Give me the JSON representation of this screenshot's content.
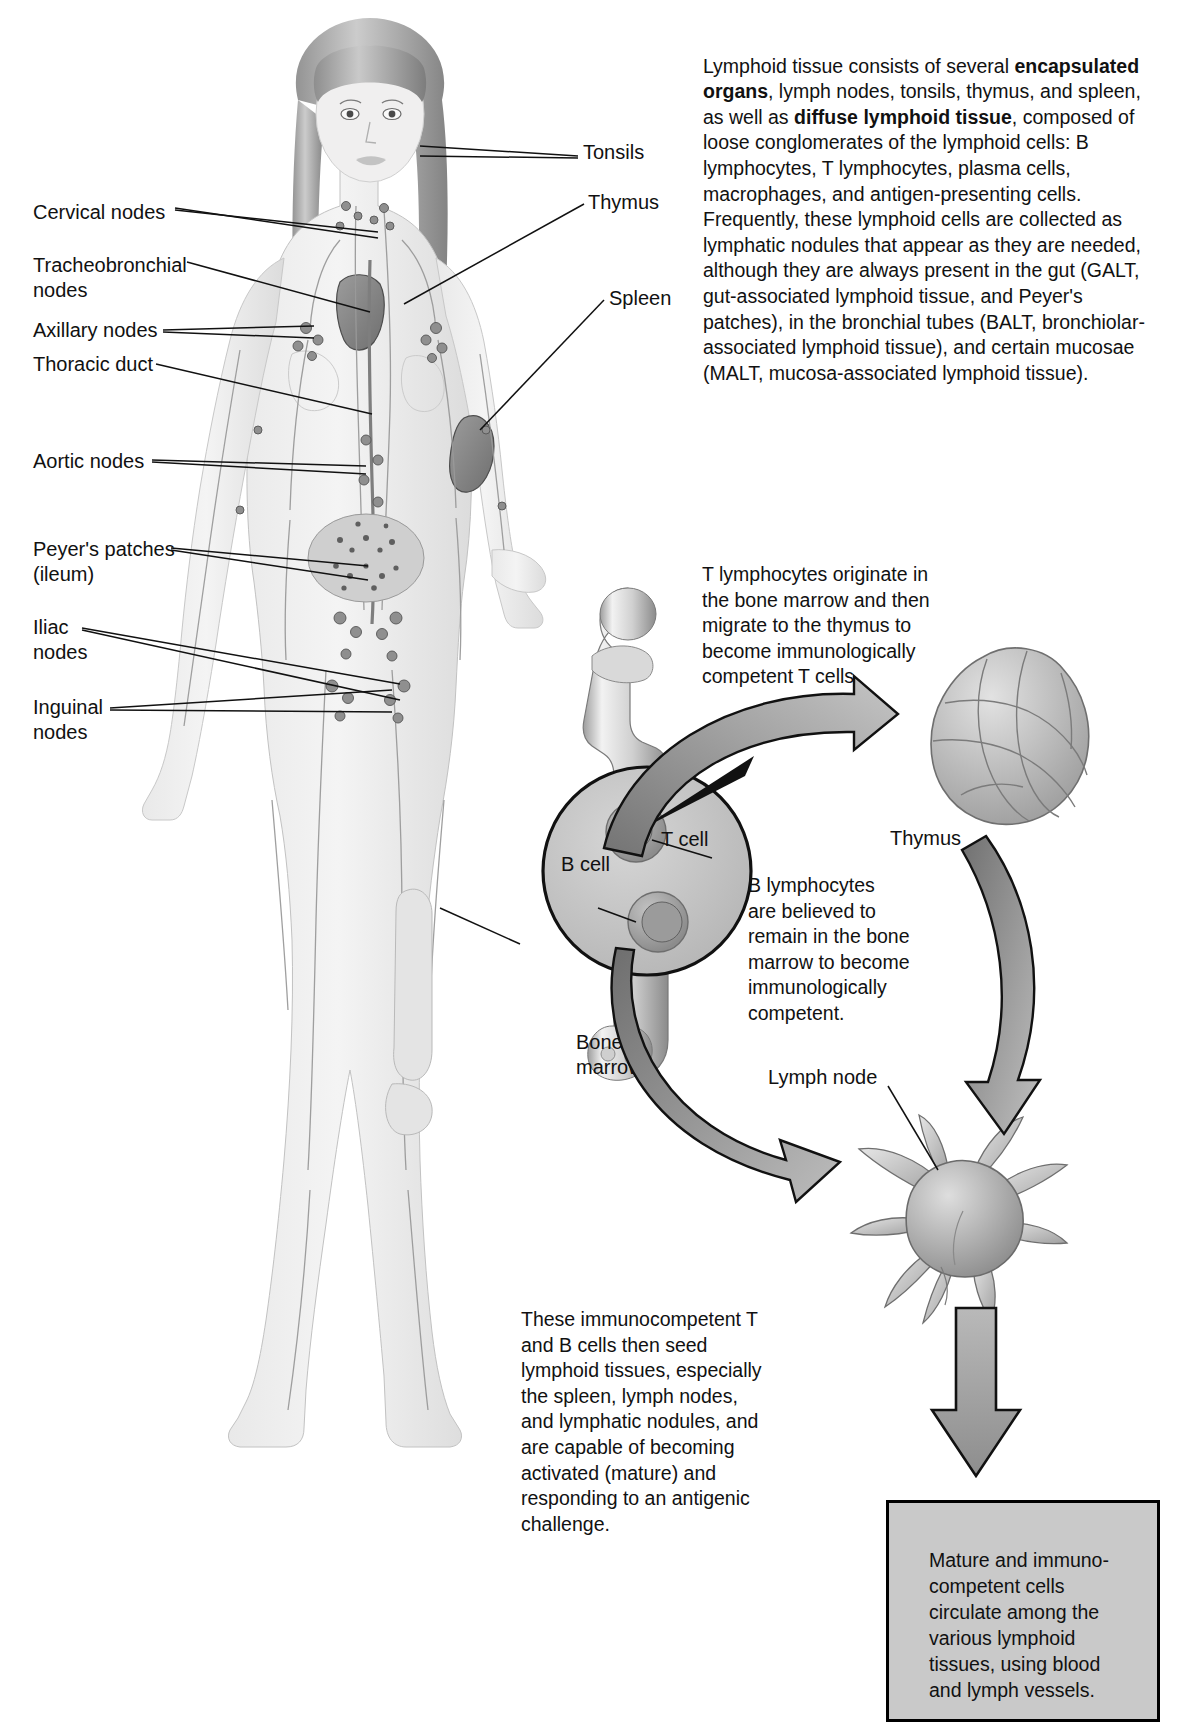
{
  "figure": {
    "title_hidden": "",
    "main_caption": "Lymphoid tissue consists of several encapsulated organs, lymph nodes, tonsils, thymus, and spleen, as well as diffuse lymphoid tissue, composed of loose conglomerates of the lymphoid cells: B lymphocytes, T lymphocytes, plasma cells, macrophages, and antigen-presenting cells. Frequently, these lymphoid cells are collected as lymphatic nodules that appear as they are needed, although they are always present in the gut (GALT, gut-associated lymphoid tissue, and Peyer's patches), in the bronchial tubes (BALT, bronchiolar-associated lymphoid tissue), and certain mucosae (MALT, mucosa-associated lymphoid tissue).",
    "main_caption_runs": [
      {
        "text": "Lymphoid tissue consists of several ",
        "bold": false
      },
      {
        "text": "encapsulated organs",
        "bold": true
      },
      {
        "text": ", lymph nodes, tonsils, thymus, and spleen, as well as ",
        "bold": false
      },
      {
        "text": "diffuse lymphoid tissue",
        "bold": true
      },
      {
        "text": ", composed of loose conglomerates of the lymphoid cells: B lymphocytes, T lymphocytes, plasma cells, macrophages, and antigen-presenting cells. Frequently, these lymphoid cells are collected as lymphatic nodules that appear as they are needed, although they are always present in the gut (GALT, gut-associated lymphoid tissue, and Peyer's patches), in the bronchial tubes (BALT, bronchiolar-associated lymphoid tissue), and certain mucosae (MALT, mucosa-associated lymphoid tissue).",
        "bold": false
      }
    ],
    "t_cell_caption": "T lymphocytes originate in\nthe bone marrow and then\nmigrate to the thymus to\nbecome immunologically\ncompetent T cells.",
    "b_cell_caption": "B lymphocytes\nare believed to\nremain in the bone\nmarrow to become\nimmunologically\ncompetent.",
    "seed_caption": "These immunocompetent T\nand B cells then seed\nlymphoid tissues, especially\nthe spleen, lymph nodes,\nand lymphatic nodules, and\nare capable of becoming\nactivated (mature) and\nresponding to an antigenic\nchallenge.",
    "box_caption": "Mature and immuno-\ncompetent cells\ncirculate among the\nvarious lymphoid\ntissues, using blood\nand lymph vessels."
  },
  "labels_left": [
    {
      "id": "cervical-nodes",
      "text": "Cervical nodes"
    },
    {
      "id": "tracheobronchial-nodes",
      "text": "Tracheobronchial\nnodes"
    },
    {
      "id": "axillary-nodes",
      "text": "Axillary nodes"
    },
    {
      "id": "thoracic-duct",
      "text": "Thoracic duct"
    },
    {
      "id": "aortic-nodes",
      "text": "Aortic nodes"
    },
    {
      "id": "peyers-patches",
      "text": "Peyer's patches\n(ileum)"
    },
    {
      "id": "iliac-nodes",
      "text": "Iliac\nnodes"
    },
    {
      "id": "inguinal-nodes",
      "text": "Inguinal\nnodes"
    }
  ],
  "labels_right": [
    {
      "id": "tonsils",
      "text": "Tonsils"
    },
    {
      "id": "thymus-body",
      "text": "Thymus"
    },
    {
      "id": "spleen",
      "text": "Spleen"
    }
  ],
  "labels_diagram": [
    {
      "id": "t-cell",
      "text": "T cell"
    },
    {
      "id": "b-cell",
      "text": "B cell"
    },
    {
      "id": "bone-marrow",
      "text": "Bone\nmarrow"
    },
    {
      "id": "thymus-organ",
      "text": "Thymus"
    },
    {
      "id": "lymph-node",
      "text": "Lymph node"
    }
  ],
  "colors": {
    "ink": "#111111",
    "box_fill": "#c9c9c9",
    "box_border": "#000000",
    "arrow_fill": "#8f8f8f",
    "tissue_light": "#d8d8d8",
    "tissue_mid": "#b3b3b3",
    "tissue_dark": "#8a8a8a"
  }
}
